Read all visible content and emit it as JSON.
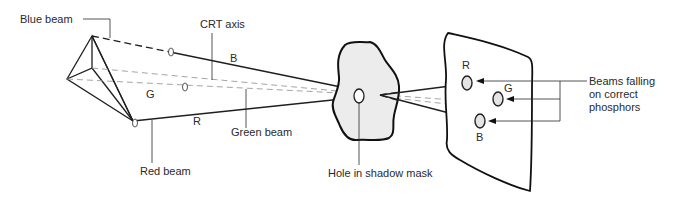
{
  "diagram": {
    "labels": {
      "blue_beam": "Blue beam",
      "crt_axis": "CRT axis",
      "red_beam": "Red beam",
      "green_beam": "Green beam",
      "hole_in_shadow_mask": "Hole in shadow mask",
      "beams_falling_line1": "Beams falling",
      "beams_falling_line2": "on correct",
      "beams_falling_line3": "phosphors"
    },
    "beam_letters": {
      "b_on_beam": "B",
      "g_on_beam": "G",
      "r_on_beam": "R",
      "r_dot": "R",
      "g_dot": "G",
      "b_dot": "B"
    },
    "components": [
      "electron-gun-assembly",
      "shadow-mask",
      "phosphor-screen"
    ],
    "colors": {
      "line": "#1f1f1f",
      "axis_dash": "#9a9a9a",
      "mask_fill": "#ececec",
      "dot_fill": "#e4e4e4"
    }
  }
}
